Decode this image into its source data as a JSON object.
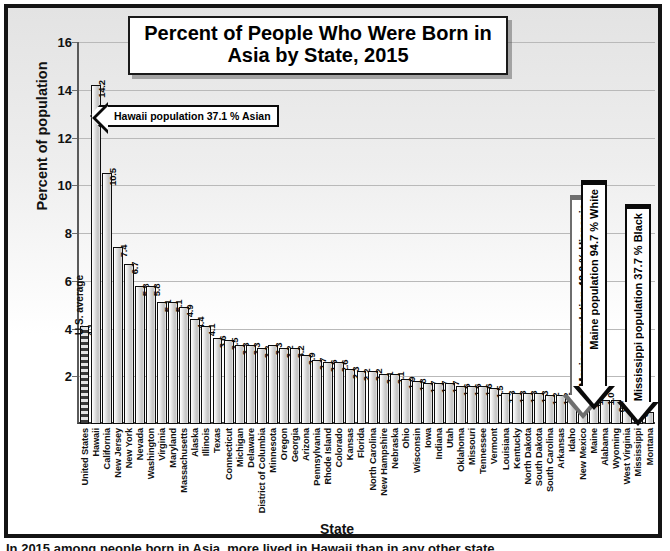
{
  "chart_data": {
    "type": "bar",
    "title": "Percent of People Who Were Born in Asia by State, 2015",
    "title_line1": "Percent of People Who Were Born in",
    "title_line2": "Asia by State, 2015",
    "xlabel": "State",
    "ylabel": "Percent of population",
    "ylim": [
      0,
      16
    ],
    "yticks": [
      0,
      2,
      4,
      6,
      8,
      10,
      12,
      14,
      16
    ],
    "ytick_labels": [
      "0",
      "2",
      "4",
      "6",
      "8",
      "10",
      "12",
      "14",
      "16"
    ],
    "grid": true,
    "legend": "none",
    "categories": [
      "United States",
      "Hawaii",
      "California",
      "New Jersey",
      "New York",
      "Nevada",
      "Washington",
      "Virginia",
      "Maryland",
      "Massachusetts",
      "Alaska",
      "Illinois",
      "Texas",
      "Connecticut",
      "Michigan",
      "Delaware",
      "District of Columbia",
      "Minnesota",
      "Oregon",
      "Georgia",
      "Arizona",
      "Pennsylvania",
      "Rhode Island",
      "Colorado",
      "Kansas",
      "Florida",
      "North Carolina",
      "New Hampshire",
      "Nebraska",
      "Ohio",
      "Wisconsin",
      "Iowa",
      "Indiana",
      "Utah",
      "Oklahoma",
      "Missouri",
      "Tennessee",
      "Vermont",
      "Louisiana",
      "Kentucky",
      "North Dakota",
      "South Dakota",
      "South Carolina",
      "Arkansas",
      "Idaho",
      "New Mexico",
      "Maine",
      "Alabama",
      "Wyoming",
      "West Virginia",
      "Mississippi",
      "Montana"
    ],
    "values": [
      4.1,
      14.2,
      10.5,
      7.4,
      6.7,
      5.8,
      5.8,
      5.1,
      5.1,
      4.9,
      4.4,
      4.1,
      3.6,
      3.5,
      3.3,
      3.3,
      3.2,
      3.3,
      3.2,
      3.2,
      2.9,
      2.7,
      2.6,
      2.6,
      2.3,
      2.2,
      2.2,
      2.1,
      2.1,
      1.9,
      1.8,
      1.7,
      1.7,
      1.7,
      1.6,
      1.6,
      1.6,
      1.5,
      1.3,
      1.3,
      1.3,
      1.3,
      1.2,
      1.2,
      1.2,
      1.1,
      1.1,
      1.0,
      1.0,
      0.7,
      0.7,
      0.5
    ],
    "value_labels": [
      "4.1",
      "14.2",
      "10.5",
      "7.4",
      "6.7",
      "5.8",
      "5.8",
      "5.1",
      "5.1",
      "4.9",
      "4.4",
      "4.1",
      "3.6",
      "3.5",
      "3.3",
      "3.3",
      "3.2",
      "3.3",
      "3.2",
      "3.2",
      "2.9",
      "2.7",
      "2.6",
      "2.6",
      "2.3",
      "2.2",
      "2.2",
      "2.1",
      "2.1",
      "1.9",
      "1.8",
      "1.7",
      "1.7",
      "1.7",
      "1.6",
      "1.6",
      "1.6",
      "1.5",
      "1.3",
      "1.3",
      "1.3",
      "1.3",
      "1.2",
      "1.2",
      "1.2",
      "1.1",
      "1.1",
      "1.0",
      "1.0",
      "0.7",
      "0.7",
      "0.5"
    ],
    "reference_bar": {
      "index": 0,
      "label": "U.S. average",
      "value": 4.1,
      "style": "hatched"
    }
  },
  "annotations": {
    "hawaii": {
      "text": "Hawaii population 37.1 % Asian",
      "points_to": "Hawaii",
      "direction": "left",
      "color": "#0a0a0a"
    },
    "new_mexico": {
      "text": "New Mexico population 48.0 % Hispanic",
      "points_to": "New Mexico",
      "direction": "down",
      "color": "#6e6e6e"
    },
    "maine": {
      "text": "Maine population 94.7 % White",
      "points_to": "Maine",
      "direction": "down",
      "color": "#0a0a0a"
    },
    "mississippi": {
      "text": "Mississippi population 37.7 % Black",
      "points_to": "Mississippi",
      "direction": "down",
      "color": "#0a0a0a"
    }
  },
  "bottom_caption": "In 2015 among people born in Asia, more lived in Hawaii than in any other state.",
  "colors": {
    "frame": "#141414",
    "grid": "#b9b9b9",
    "bar_fill": "#d2d2d2",
    "bar_edge": "#0d0d0d",
    "text": "#111111",
    "background": "#ffffff"
  }
}
